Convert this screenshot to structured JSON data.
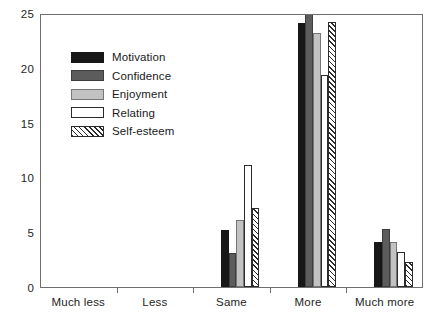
{
  "chart_data": {
    "type": "bar",
    "title": "",
    "subtitle": "",
    "xlabel": "",
    "ylabel": "",
    "categories": [
      "Much less",
      "Less",
      "Same",
      "More",
      "Much more"
    ],
    "ylim": [
      0,
      25
    ],
    "y_ticks": [
      0,
      5,
      10,
      15,
      20,
      25
    ],
    "y_tick_labels": [
      "0",
      "5",
      "10",
      "15",
      "20",
      "25"
    ],
    "grid": false,
    "legend_position": "upper-left",
    "series": [
      {
        "name": "Motivation",
        "color": "#171717",
        "fill": "solid",
        "values": [
          0,
          0,
          5.2,
          24.1,
          4.1
        ]
      },
      {
        "name": "Confidence",
        "color": "#5c5c5c",
        "fill": "solid",
        "values": [
          0,
          0,
          3.1,
          25.3,
          5.3
        ]
      },
      {
        "name": "Enjoyment",
        "color": "#c2c2c2",
        "fill": "solid",
        "values": [
          0,
          0,
          6.1,
          23.2,
          4.1
        ]
      },
      {
        "name": "Relating",
        "color": "#ffffff",
        "fill": "open",
        "values": [
          0,
          0,
          11.1,
          19.3,
          3.2
        ]
      },
      {
        "name": "Self-esteem",
        "color": "#ffffff",
        "fill": "hatch",
        "values": [
          0,
          0,
          7.2,
          24.2,
          2.3
        ]
      }
    ]
  },
  "axes": {
    "frame_color": "#6f6f6f",
    "tick_color": "#6f6f6f",
    "text_color": "#1e1e1e"
  }
}
